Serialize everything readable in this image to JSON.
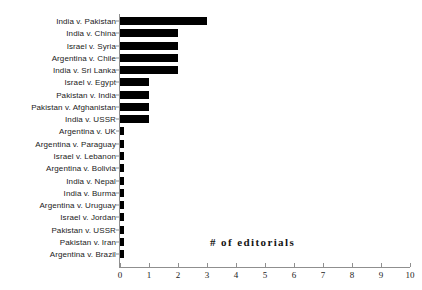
{
  "chart_data": {
    "type": "bar",
    "orientation": "horizontal",
    "title": "",
    "xlabel": "# of editorials",
    "ylabel": "",
    "xlim": [
      0,
      10
    ],
    "xticks": [
      0,
      1,
      2,
      3,
      4,
      5,
      6,
      7,
      8,
      9,
      10
    ],
    "xtick_labels": [
      "0",
      "1",
      "2",
      "3",
      "4",
      "5",
      "6",
      "7",
      "8",
      "9",
      "10"
    ],
    "grid": false,
    "legend": null,
    "bar_color": "#000000",
    "axis_color": "#8f8f8f",
    "categories": [
      "India v. Pakistan",
      "India v. China",
      "Israel v. Syria",
      "Argentina v. Chile",
      "India v. Sri Lanka",
      "Israel v. Egypt",
      "Pakistan v. India",
      "Pakistan v. Afghanistan",
      "India v. USSR",
      "Argentina v. UK",
      "Argentina v. Paraguay",
      "Israel v. Lebanon",
      "Argentina v. Bolivia",
      "India v. Nepal",
      "India v. Burma",
      "Argentina v. Uruguay",
      "Israel v. Jordan",
      "Pakistan v. USSR",
      "Pakistan v. Iran",
      "Argentina v. Brazil"
    ],
    "values": [
      3,
      2,
      2,
      2,
      2,
      1,
      1,
      1,
      1,
      0.13,
      0.13,
      0.13,
      0.13,
      0.13,
      0.13,
      0.13,
      0.13,
      0.13,
      0.13,
      0.13
    ]
  }
}
